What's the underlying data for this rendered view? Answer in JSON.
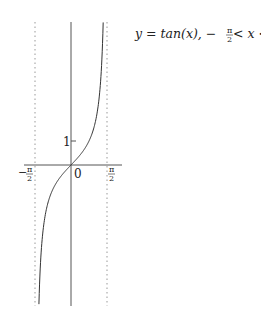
{
  "chart_data": {
    "type": "line",
    "xlabel": "",
    "ylabel": "",
    "x_tick_labels": [
      "−π/2",
      "0",
      "π/2"
    ],
    "y_tick_labels": [
      "1"
    ],
    "xlim": [
      -1.5708,
      1.5708
    ],
    "ylim": [
      -5.85,
      5.9
    ],
    "grid": false,
    "legend": null,
    "asymptotes": [
      {
        "x": -1.5708,
        "style": "dotted"
      },
      {
        "x": 1.5708,
        "style": "dotted"
      }
    ],
    "series": [
      {
        "name": "tan(x)",
        "function": "tan(x)",
        "x": [
          -1.4,
          -1.3,
          -1.2,
          -1.0,
          -0.8,
          -0.6,
          -0.4,
          -0.2,
          0,
          0.2,
          0.4,
          0.6,
          0.8,
          1.0,
          1.2,
          1.3,
          1.404
        ],
        "values": [
          -5.8,
          -3.6,
          -2.57,
          -1.56,
          -1.03,
          -0.68,
          -0.42,
          -0.2,
          0,
          0.2,
          0.42,
          0.68,
          1.03,
          1.56,
          2.57,
          3.6,
          5.9
        ]
      }
    ]
  },
  "labels": {
    "equation_lhs": "y = tan(x), −",
    "pi": "π",
    "two": "2",
    "lt1": " < x < ",
    "origin": "0",
    "one": "1",
    "neg": "−"
  }
}
